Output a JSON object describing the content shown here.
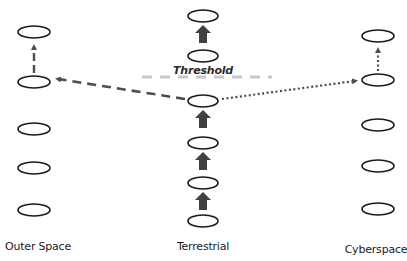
{
  "diagram": {
    "colors": {
      "node_stroke": "#1a1a1a",
      "arrow_fill": "#404040",
      "dashed_arrow": "#4d4d4d",
      "dotted_arrow": "#4d4d4d",
      "threshold_line": "#c8c8c8"
    },
    "threshold": {
      "label": "Threshold",
      "y": 77
    },
    "columns": [
      {
        "id": "outer-space",
        "label": "Outer Space",
        "x": 34,
        "label_y": 240,
        "nodes_y": [
          32,
          82,
          129,
          168,
          210
        ]
      },
      {
        "id": "terrestrial",
        "label": "Terrestrial",
        "x": 203,
        "label_y": 240,
        "nodes_y": [
          16,
          56,
          101,
          143,
          183,
          221
        ]
      },
      {
        "id": "cyberspace",
        "label": "Cyberspace",
        "x": 378,
        "label_y": 243,
        "nodes_y": [
          36,
          80,
          125,
          166,
          209
        ]
      }
    ],
    "edges": [
      {
        "type": "dashed",
        "from": "terrestrial node 3",
        "to": "outer-space node 2"
      },
      {
        "type": "dotted",
        "from": "terrestrial node 3",
        "to": "cyberspace node 2"
      },
      {
        "type": "short-dashed-up",
        "column": "outer-space",
        "from_node": 2,
        "to_node": 1
      },
      {
        "type": "dotted-up",
        "column": "cyberspace",
        "from_node": 2,
        "to_node": 1
      },
      {
        "type": "block-arrow-up",
        "column": "terrestrial",
        "count": 4
      }
    ]
  }
}
